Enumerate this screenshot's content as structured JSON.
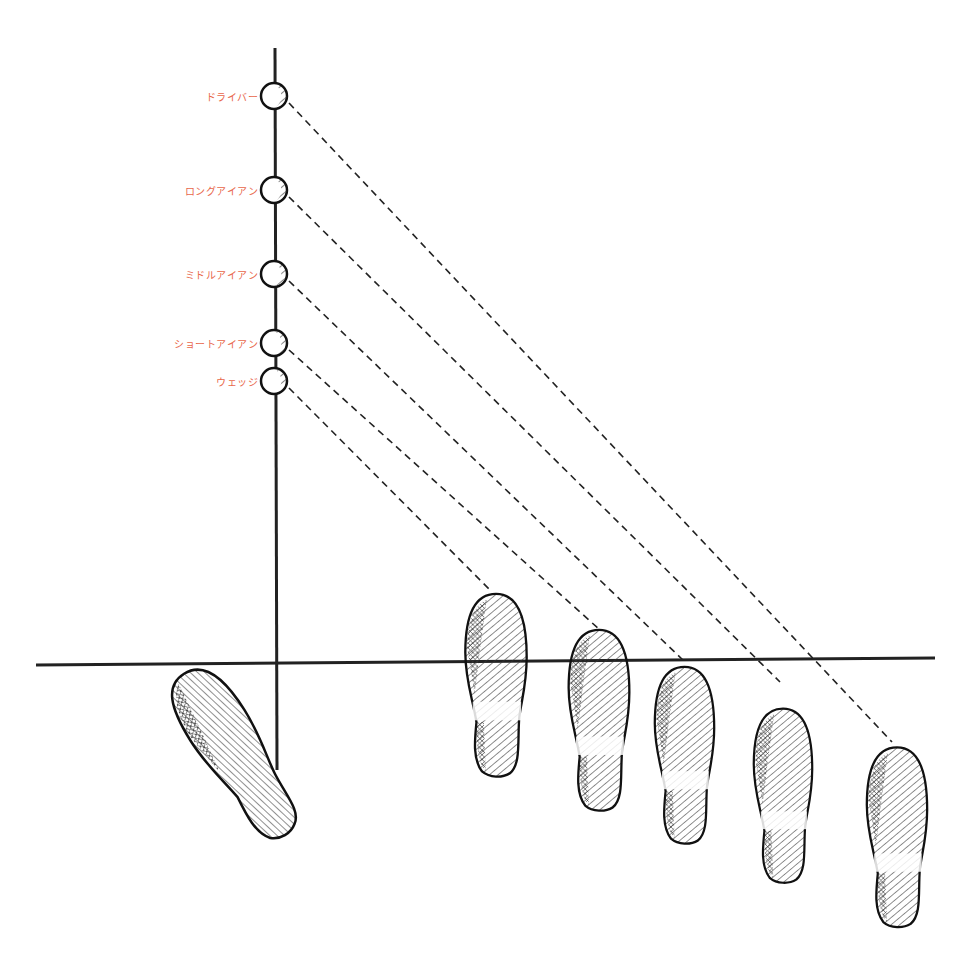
{
  "diagram": {
    "type": "golf-ball-position-vs-stance",
    "colors": {
      "label": "#e8664a",
      "line": "#222222",
      "background": "#ffffff"
    },
    "clubs": [
      {
        "label": "ドライバー",
        "ball_y": 96
      },
      {
        "label": "ロングアイアン",
        "ball_y": 190
      },
      {
        "label": "ミドルアイアン",
        "ball_y": 274
      },
      {
        "label": "ショートアイアン",
        "ball_y": 343
      },
      {
        "label": "ウェッジ",
        "ball_y": 381
      }
    ],
    "footprints": {
      "left_foot": "fixed-left-foot",
      "right_foot_positions": [
        "wedge",
        "short-iron",
        "middle-iron",
        "long-iron",
        "driver"
      ]
    }
  }
}
